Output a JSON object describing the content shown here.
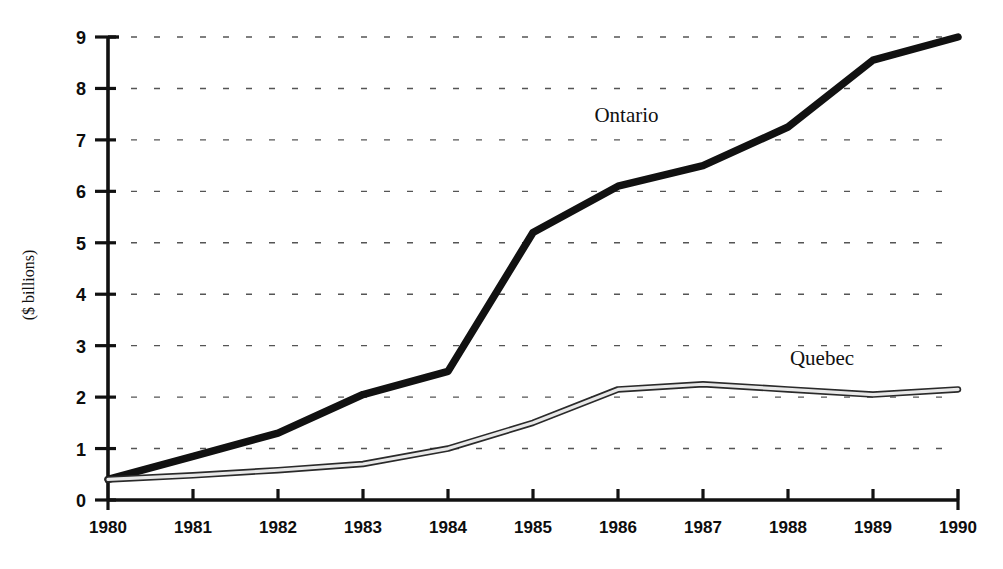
{
  "chart_data": {
    "type": "line",
    "title": "",
    "subtitle": "",
    "xlabel": "",
    "ylabel": "($ billions)",
    "x": [
      1980,
      1981,
      1982,
      1983,
      1984,
      1985,
      1986,
      1987,
      1988,
      1989,
      1990
    ],
    "xticklabels": [
      "1980",
      "1981",
      "1982",
      "1983",
      "1984",
      "1985",
      "1986",
      "1987",
      "1988",
      "1989",
      "1990"
    ],
    "yticklabels": [
      "0",
      "1",
      "2",
      "3",
      "4",
      "5",
      "6",
      "7",
      "8",
      "9"
    ],
    "yticks": [
      0,
      1,
      2,
      3,
      4,
      5,
      6,
      7,
      8,
      9
    ],
    "ylim": [
      0,
      9
    ],
    "xlim": [
      1980,
      1990
    ],
    "grid": "horizontal-dashed",
    "legend": "inline-labels",
    "series": [
      {
        "name": "Ontario",
        "style": "thick-solid-black",
        "color": "#111111",
        "label_x": 1986.1,
        "label_y": 7.35,
        "values": [
          0.4,
          0.85,
          1.3,
          2.05,
          2.5,
          5.2,
          6.1,
          6.5,
          7.25,
          8.55,
          9.0
        ]
      },
      {
        "name": "Quebec",
        "style": "thin-hollow-band",
        "color": "#2a2a2a",
        "fill": "#e8e8e8",
        "label_x": 1988.4,
        "label_y": 2.62,
        "values": [
          0.4,
          0.48,
          0.58,
          0.7,
          1.0,
          1.5,
          2.15,
          2.25,
          2.15,
          2.05,
          2.15
        ]
      }
    ]
  }
}
